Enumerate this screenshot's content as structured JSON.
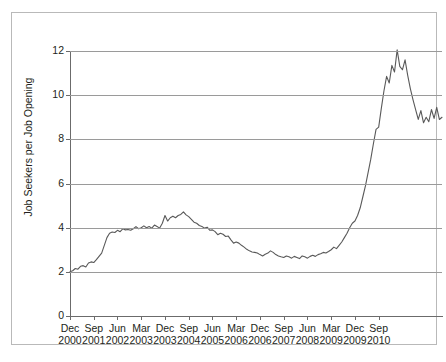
{
  "chart_data": {
    "type": "line",
    "title": "",
    "xlabel": "",
    "ylabel": "Job Seekers per Job Opening",
    "ylim": [
      0,
      12
    ],
    "yticks": [
      0,
      2,
      4,
      6,
      8,
      10,
      12
    ],
    "grid": true,
    "legend": "none",
    "line_color": "#595959",
    "x_tick_labels": [
      {
        "line1": "Dec",
        "line2": "2000"
      },
      {
        "line1": "Sep",
        "line2": "2001"
      },
      {
        "line1": "Jun",
        "line2": "2002"
      },
      {
        "line1": "Mar",
        "line2": "2003"
      },
      {
        "line1": "Dec",
        "line2": "2003"
      },
      {
        "line1": "Sep",
        "line2": "2004"
      },
      {
        "line1": "Jun",
        "line2": "2005"
      },
      {
        "line1": "Mar",
        "line2": "2006"
      },
      {
        "line1": "Dec",
        "line2": "2006"
      },
      {
        "line1": "Sep",
        "line2": "2007"
      },
      {
        "line1": "Jun",
        "line2": "2008"
      },
      {
        "line1": "Mar",
        "line2": "2009"
      },
      {
        "line1": "Dec",
        "line2": "2009"
      },
      {
        "line1": "Sep",
        "line2": "2010"
      }
    ],
    "x_tick_interval_months": 9,
    "x_start": "2000-12",
    "x_end": "2010-10",
    "series": [
      {
        "name": "Job Seekers per Job Opening",
        "values": [
          2.0,
          2.05,
          2.15,
          2.12,
          2.25,
          2.28,
          2.22,
          2.4,
          2.45,
          2.42,
          2.55,
          2.7,
          2.85,
          3.2,
          3.55,
          3.75,
          3.8,
          3.78,
          3.88,
          3.82,
          3.95,
          3.9,
          3.92,
          3.88,
          3.95,
          4.05,
          3.95,
          4.0,
          4.08,
          4.0,
          4.05,
          3.98,
          4.12,
          4.05,
          3.98,
          4.2,
          4.55,
          4.3,
          4.45,
          4.52,
          4.45,
          4.55,
          4.6,
          4.72,
          4.58,
          4.5,
          4.38,
          4.25,
          4.2,
          4.1,
          4.05,
          3.98,
          4.02,
          3.88,
          3.9,
          3.82,
          3.68,
          3.75,
          3.7,
          3.6,
          3.62,
          3.45,
          3.3,
          3.35,
          3.3,
          3.2,
          3.12,
          3.02,
          2.95,
          2.9,
          2.88,
          2.85,
          2.78,
          2.72,
          2.8,
          2.85,
          2.95,
          2.88,
          2.78,
          2.72,
          2.68,
          2.65,
          2.72,
          2.68,
          2.62,
          2.7,
          2.65,
          2.6,
          2.72,
          2.68,
          2.62,
          2.7,
          2.75,
          2.7,
          2.78,
          2.82,
          2.88,
          2.85,
          2.92,
          3.0,
          3.12,
          3.05,
          3.2,
          3.35,
          3.55,
          3.75,
          4.0,
          4.2,
          4.3,
          4.55,
          4.9,
          5.4,
          5.9,
          6.5,
          7.1,
          7.8,
          8.45,
          8.55,
          9.4,
          10.2,
          10.85,
          10.55,
          11.35,
          11.05,
          12.05,
          11.3,
          11.15,
          11.6,
          10.9,
          10.3,
          9.8,
          9.35,
          8.9,
          9.3,
          8.75,
          9.0,
          8.8,
          9.35,
          8.95,
          9.45,
          8.9,
          9.0
        ]
      }
    ]
  }
}
